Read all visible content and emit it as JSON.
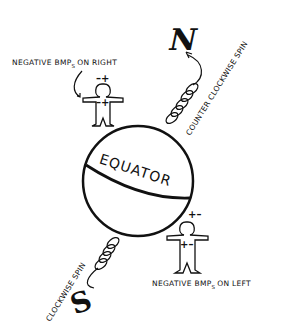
{
  "diagram": {
    "globe": {
      "label": "EQUATOR"
    },
    "poles": {
      "north": "N",
      "south": "S"
    },
    "spins": {
      "north": "COUNTER CLOCKWISE SPIN",
      "south": "CLOCKWISE SPIN"
    },
    "figures": {
      "top": {
        "caption_main": "NEGATIVE BMP",
        "caption_sub": "S",
        "caption_rest": "ON RIGHT",
        "head_signs": "–+",
        "body_signs": "–+"
      },
      "bottom": {
        "caption_main": "NEGATIVE BMP",
        "caption_sub": "S",
        "caption_rest": "ON LEFT",
        "head_signs": "+–",
        "body_signs": "+–"
      }
    }
  }
}
